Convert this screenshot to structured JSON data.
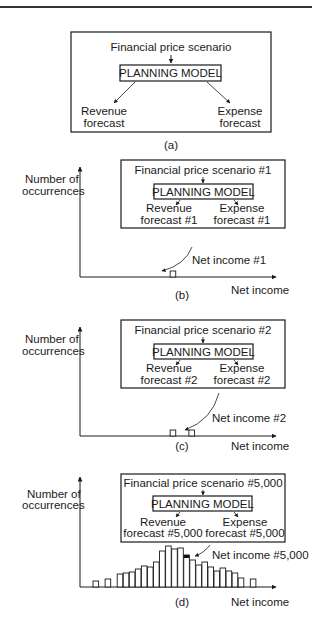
{
  "panels": {
    "a": {
      "scenario": "Financial price scenario",
      "model": "PLANNING MODEL",
      "revenue": [
        "Revenue",
        "forecast"
      ],
      "expense": [
        "Expense",
        "forecast"
      ],
      "caption": "(a)"
    },
    "b": {
      "scenario": "Financial price scenario #1",
      "model": "PLANNING MODEL",
      "revenue": [
        "Revenue",
        "forecast #1"
      ],
      "expense": [
        "Expense",
        "forecast #1"
      ],
      "ylabel": [
        "Number of",
        "occurrences"
      ],
      "xlabel": "Net income",
      "net_income_label": "Net income #1",
      "caption": "(b)"
    },
    "c": {
      "scenario": "Financial price scenario #2",
      "model": "PLANNING MODEL",
      "revenue": [
        "Revenue",
        "forecast #2"
      ],
      "expense": [
        "Expense",
        "forecast #2"
      ],
      "ylabel": [
        "Number of",
        "occurrences"
      ],
      "xlabel": "Net income",
      "net_income_label": "Net income #2",
      "caption": "(c)"
    },
    "d": {
      "scenario": "Financial price scenario #5,000",
      "model": "PLANNING MODEL",
      "revenue": [
        "Revenue",
        "forecast #5,000"
      ],
      "expense": [
        "Expense",
        "forecast #5,000"
      ],
      "ylabel": [
        "Number of",
        "occurrences"
      ],
      "xlabel": "Net income",
      "net_income_label": "Net income #5,000",
      "caption": "(d)"
    }
  },
  "histogram": {
    "bins": [
      {
        "slot": 0,
        "count": 6
      },
      {
        "slot": 2,
        "count": 8
      },
      {
        "slot": 4,
        "count": 13
      },
      {
        "slot": 5,
        "count": 14
      },
      {
        "slot": 6,
        "count": 15
      },
      {
        "slot": 7,
        "count": 18
      },
      {
        "slot": 8,
        "count": 21
      },
      {
        "slot": 9,
        "count": 20
      },
      {
        "slot": 10,
        "count": 25
      },
      {
        "slot": 11,
        "count": 36
      },
      {
        "slot": 12,
        "count": 41
      },
      {
        "slot": 13,
        "count": 38
      },
      {
        "slot": 14,
        "count": 39
      },
      {
        "slot": 15,
        "count": 32
      },
      {
        "slot": 16,
        "count": 27
      },
      {
        "slot": 17,
        "count": 22
      },
      {
        "slot": 18,
        "count": 25
      },
      {
        "slot": 19,
        "count": 20
      },
      {
        "slot": 20,
        "count": 16
      },
      {
        "slot": 21,
        "count": 19
      },
      {
        "slot": 22,
        "count": 16
      },
      {
        "slot": 23,
        "count": 14
      },
      {
        "slot": 24,
        "count": 9
      },
      {
        "slot": 26,
        "count": 8
      }
    ],
    "highlight_slot": 15,
    "panel_b_slots": [
      9
    ],
    "panel_c_slots": [
      9,
      11
    ]
  }
}
